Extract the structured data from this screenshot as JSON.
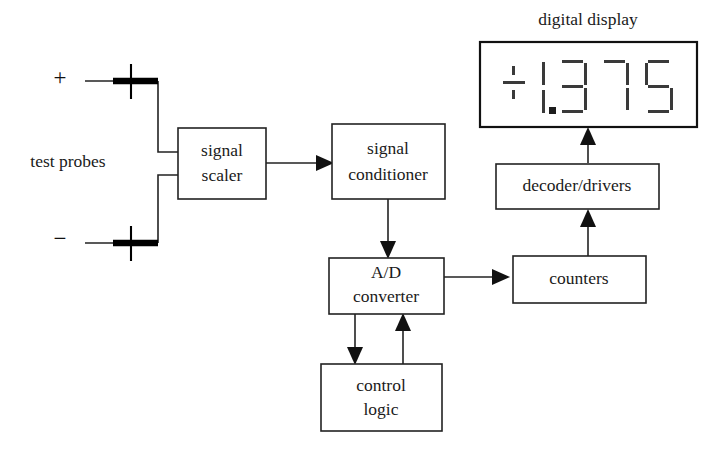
{
  "figure": {
    "kind": "block-diagram",
    "background_color": "#ffffff",
    "line_color": "#222222"
  },
  "labels": {
    "digital_display": "digital display",
    "test_probes": "test probes",
    "plus_sign": "+",
    "minus_sign": "−"
  },
  "blocks": [
    {
      "id": "signal_scaler",
      "line1": "signal",
      "line2": "scaler"
    },
    {
      "id": "signal_conditioner",
      "line1": "signal",
      "line2": "conditioner"
    },
    {
      "id": "ad_converter",
      "line1": "A/D",
      "line2": "converter"
    },
    {
      "id": "control_logic",
      "line1": "control",
      "line2": "logic"
    },
    {
      "id": "counters",
      "line1": "counters",
      "line2": ""
    },
    {
      "id": "decoder_drivers",
      "line1": "decoder/drivers",
      "line2": ""
    }
  ],
  "display": {
    "caption": "digital display",
    "reading": "+1.375",
    "sign": "+",
    "digits": [
      "1",
      "3",
      "7",
      "5"
    ],
    "decimal_point_after_digit": 1,
    "segment_color": "#3a3a3a",
    "style": "seven-segment"
  },
  "connections": [
    {
      "from": "probe_plus",
      "to": "signal_scaler",
      "arrow": false
    },
    {
      "from": "probe_minus",
      "to": "signal_scaler",
      "arrow": false
    },
    {
      "from": "signal_scaler",
      "to": "signal_conditioner",
      "arrow": true
    },
    {
      "from": "signal_conditioner",
      "to": "ad_converter",
      "arrow": true
    },
    {
      "from": "ad_converter",
      "to": "control_logic",
      "arrow": true
    },
    {
      "from": "control_logic",
      "to": "ad_converter",
      "arrow": true
    },
    {
      "from": "ad_converter",
      "to": "counters",
      "arrow": true
    },
    {
      "from": "counters",
      "to": "decoder_drivers",
      "arrow": true
    },
    {
      "from": "decoder_drivers",
      "to": "digital_display",
      "arrow": true
    }
  ]
}
